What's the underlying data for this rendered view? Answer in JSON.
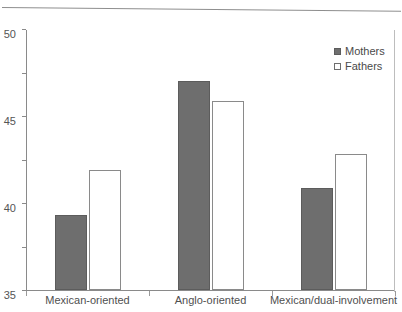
{
  "chart_data": {
    "type": "bar",
    "title": "",
    "xlabel": "",
    "ylabel": "",
    "ylim": [
      20,
      50
    ],
    "yticks": [
      20,
      25,
      30,
      35,
      40,
      45,
      50
    ],
    "grid": false,
    "legend_position": "top-right",
    "categories": [
      "Mexican-oriented",
      "Anglo-oriented",
      "Mexican/dual-involvement"
    ],
    "series": [
      {
        "name": "Mothers",
        "color": "#6e6e6e",
        "values": [
          28.6,
          44.0,
          31.7
        ]
      },
      {
        "name": "Fathers",
        "color": "#ffffff",
        "values": [
          33.8,
          41.7,
          35.6
        ]
      }
    ]
  },
  "legend": {
    "items": [
      {
        "label": "Mothers",
        "marker": "filled-square-icon"
      },
      {
        "label": "Fathers",
        "marker": "open-square-icon"
      }
    ]
  },
  "axis": {
    "y_tick_labels": [
      "20",
      "25",
      "30",
      "35",
      "40",
      "45",
      "50"
    ]
  }
}
